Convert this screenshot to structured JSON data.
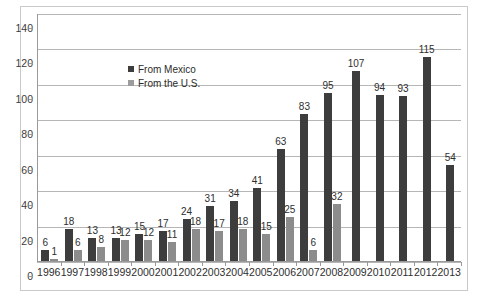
{
  "chart_data": {
    "type": "bar",
    "title": "",
    "xlabel": "",
    "ylabel": "",
    "ylim": [
      0,
      140
    ],
    "ytick_values": [
      0,
      20,
      40,
      60,
      80,
      100,
      120,
      140
    ],
    "ytick_labels": [
      "0",
      "20",
      "40",
      "60",
      "80",
      "100",
      "120",
      "140"
    ],
    "grid": true,
    "legend_position": "inside-upper-left",
    "categories": [
      "1996",
      "1997",
      "1998",
      "1999",
      "2000",
      "2001",
      "2002",
      "2003",
      "2004",
      "2005",
      "2006",
      "2007",
      "2008",
      "2009",
      "2010",
      "2011",
      "2012",
      "2013"
    ],
    "series": [
      {
        "name": "From Mexico",
        "color": "#3d3d3d",
        "values": [
          6,
          18,
          13,
          13,
          15,
          17,
          24,
          31,
          34,
          41,
          63,
          83,
          95,
          107,
          94,
          93,
          115,
          54
        ],
        "labels": [
          "6",
          "18",
          "13",
          "13",
          "15",
          "17",
          "24",
          "31",
          "34",
          "41",
          "63",
          "83",
          "95",
          "107",
          "94",
          "93",
          "115",
          "54"
        ]
      },
      {
        "name": "From the U.S.",
        "color": "#8c8c8c",
        "values": [
          1,
          6,
          8,
          12,
          12,
          11,
          18,
          17,
          18,
          15,
          25,
          6,
          32,
          null,
          null,
          null,
          null,
          null
        ],
        "labels": [
          "1",
          "6",
          "8",
          "12",
          "12",
          "11",
          "18",
          "17",
          "18",
          "15",
          "25",
          "6",
          "32",
          "",
          "",
          "",
          "",
          ""
        ]
      }
    ]
  },
  "legend": {
    "items": [
      {
        "label": "From Mexico",
        "color": "#3d3d3d"
      },
      {
        "label": "From the U.S.",
        "color": "#9c9c9c"
      }
    ]
  }
}
